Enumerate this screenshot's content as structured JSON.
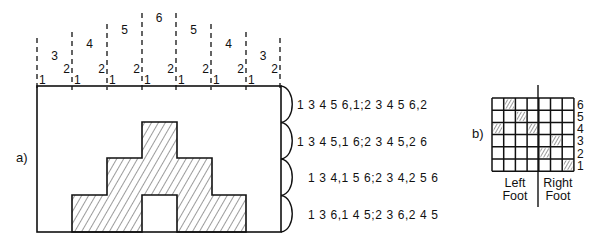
{
  "panel_a": {
    "label": "a)",
    "harness_lines": [
      {
        "x": 37,
        "top": 38
      },
      {
        "x": 72,
        "top": 32
      },
      {
        "x": 107,
        "top": 24
      },
      {
        "x": 142,
        "top": 13
      },
      {
        "x": 176,
        "top": 13
      },
      {
        "x": 211,
        "top": 24
      },
      {
        "x": 246,
        "top": 32
      },
      {
        "x": 280,
        "top": 38
      }
    ],
    "block_labels": [
      "3",
      "4",
      "5",
      "6",
      "5",
      "4",
      "3"
    ],
    "block_label_y": [
      60,
      48,
      34,
      22,
      34,
      48,
      60
    ],
    "left_labels": [
      "1",
      "1",
      "1",
      "1",
      "1",
      "1",
      "1"
    ],
    "right_labels": [
      "2",
      "2",
      "2",
      "2",
      "2",
      "2",
      "2"
    ],
    "frame": {
      "x": 37,
      "y": 86,
      "w": 244,
      "h": 146
    },
    "motif_tiers": [
      {
        "x": 142,
        "y": 122,
        "w": 35,
        "h": 36
      },
      {
        "x": 107,
        "y": 158,
        "w": 105,
        "h": 37
      },
      {
        "x": 72,
        "y": 195,
        "w": 174,
        "h": 37
      }
    ],
    "motif_gap": {
      "x": 142,
      "y": 195,
      "w": 35,
      "h": 37
    },
    "treadling_sequences": [
      "1 3 4 5 6,1;2 3 4 5 6,2",
      "1 3 4 5,1 6;2 3 4 5,2 6",
      "1 3 4,1 5 6;2 3 4,2 5 6",
      "1 3 6,1 4 5;2 3 6,2 4 5"
    ]
  },
  "panel_b": {
    "label": "b)",
    "grid": {
      "x": 492,
      "y": 98,
      "cols": 7,
      "rows": 6,
      "cell_w": 11.7,
      "cell_h": 12.2
    },
    "row_labels": [
      "6",
      "5",
      "4",
      "3",
      "2",
      "1"
    ],
    "hatched_cells": [
      {
        "row": 6,
        "col": 2
      },
      {
        "row": 5,
        "col": 3
      },
      {
        "row": 4,
        "col": 1
      },
      {
        "row": 4,
        "col": 4
      },
      {
        "row": 3,
        "col": 6
      },
      {
        "row": 2,
        "col": 5
      },
      {
        "row": 1,
        "col": 7
      }
    ],
    "divider_x": 538,
    "left_caption": [
      "Left",
      "Foot"
    ],
    "right_caption": [
      "Right",
      "Foot"
    ]
  }
}
